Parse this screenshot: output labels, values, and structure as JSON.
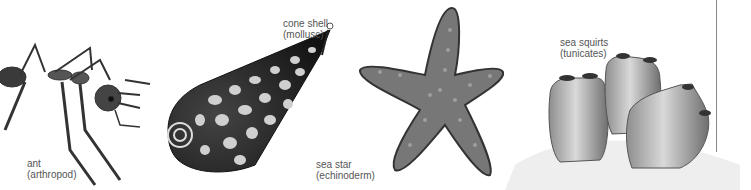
{
  "figure": {
    "specimens": [
      {
        "id": "ant",
        "name": "ant",
        "group": "(arthropod)"
      },
      {
        "id": "cone-shell",
        "name": "cone shell",
        "group": "(mollusc)"
      },
      {
        "id": "sea-star",
        "name": "sea star",
        "group": "(echinoderm)"
      },
      {
        "id": "sea-squirts",
        "name": "sea squirts",
        "group": "(tunicates)"
      }
    ]
  }
}
